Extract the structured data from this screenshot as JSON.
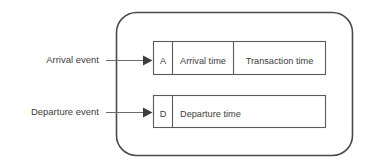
{
  "figure": {
    "background_color": "#ffffff",
    "line_color": "#4a4a4a",
    "text_color": "#3d3d3d"
  },
  "annotations": [
    {
      "id": "arrival",
      "label": "Arrival event",
      "points_to": "arrival-record"
    },
    {
      "id": "departure",
      "label": "Departure event",
      "points_to": "departure-record"
    }
  ],
  "records": [
    {
      "id": "arrival-record",
      "name": "Arrival record",
      "fields": [
        {
          "name": "type-code",
          "text": "A"
        },
        {
          "name": "arrival-time",
          "text": "Arrival time"
        },
        {
          "name": "transaction-time",
          "text": "Transaction time"
        }
      ]
    },
    {
      "id": "departure-record",
      "name": "Departure record",
      "fields": [
        {
          "name": "type-code",
          "text": "D"
        },
        {
          "name": "departure-time",
          "text": "Departure time"
        }
      ]
    }
  ]
}
